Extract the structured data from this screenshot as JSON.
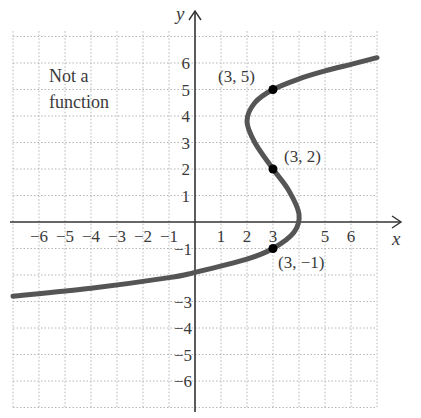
{
  "chart_data": {
    "type": "line",
    "title": "",
    "annotation": "Not a function",
    "xlabel": "x",
    "ylabel": "y",
    "xlim": [
      -7,
      7
    ],
    "ylim": [
      -7,
      7
    ],
    "grid": true,
    "x_ticks": [
      "-6",
      "-5",
      "-4",
      "-3",
      "-2",
      "-1",
      "1",
      "2",
      "3",
      "5",
      "6"
    ],
    "y_ticks": [
      "6",
      "5",
      "4",
      "3",
      "2",
      "1",
      "-1",
      "-3",
      "-4",
      "-5",
      "-6"
    ],
    "curve": {
      "description": "sideways cubic-like curve x = f(y); fails vertical line test",
      "points": [
        [
          -7,
          -2.8
        ],
        [
          -4,
          -2.5
        ],
        [
          -1,
          -2.1
        ],
        [
          0,
          -1.9
        ],
        [
          2,
          -1.4
        ],
        [
          3,
          -1
        ],
        [
          3.8,
          -0.4
        ],
        [
          4,
          0.3
        ],
        [
          3.6,
          1.2
        ],
        [
          3,
          2
        ],
        [
          2.3,
          3
        ],
        [
          2,
          3.8
        ],
        [
          2.3,
          4.5
        ],
        [
          3,
          5
        ],
        [
          4,
          5.4
        ],
        [
          5,
          5.7
        ],
        [
          6,
          5.95
        ],
        [
          7,
          6.2
        ]
      ]
    },
    "marked_points": [
      {
        "x": 3,
        "y": 5,
        "label": "(3, 5)"
      },
      {
        "x": 3,
        "y": 2,
        "label": "(3, 2)"
      },
      {
        "x": 3,
        "y": -1,
        "label": "(3, −1)"
      }
    ]
  },
  "labels": {
    "annotation_line1": "Not a",
    "annotation_line2": "function",
    "x_axis": "x",
    "y_axis": "y",
    "p1": "(3, 5)",
    "p2": "(3, 2)",
    "p3": "(3, −1)",
    "xt": [
      "−6",
      "−5",
      "−4",
      "−3",
      "−2",
      "−1",
      "1",
      "2",
      "3",
      "5",
      "6"
    ],
    "yt_pos": [
      "6",
      "5",
      "4",
      "3",
      "2",
      "1"
    ],
    "yt_neg": [
      "−1",
      "−3",
      "−4",
      "−5",
      "−6"
    ]
  }
}
